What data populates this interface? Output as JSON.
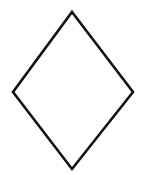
{
  "figure": {
    "shape_name": "diamond",
    "canvas": {
      "width": 144,
      "height": 175,
      "background_color": "#ffffff"
    },
    "stroke": {
      "color": "#111111",
      "width": 2.6,
      "linejoin": "miter",
      "linecap": "butt"
    },
    "fill_color": "none",
    "vertices": [
      {
        "name": "top",
        "x": 72,
        "y": 12
      },
      {
        "name": "right",
        "x": 133,
        "y": 92
      },
      {
        "name": "bottom",
        "x": 72,
        "y": 169
      },
      {
        "name": "left",
        "x": 13,
        "y": 92
      }
    ],
    "points_attribute": "72,12 133,92 72,169 13,92",
    "bounding_box": {
      "x": 13,
      "y": 12,
      "width": 120,
      "height": 157
    },
    "horizontal_diagonal": 120,
    "vertical_diagonal": 157
  }
}
